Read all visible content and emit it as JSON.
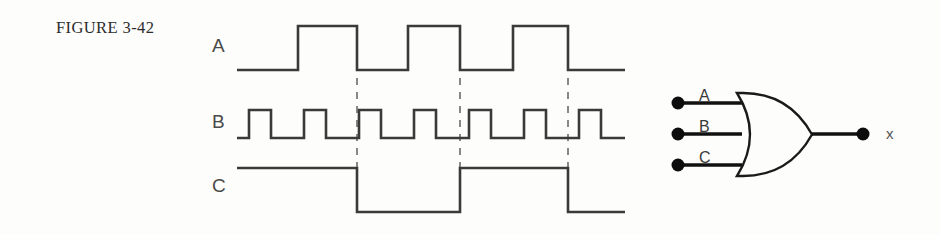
{
  "figure": {
    "caption": "FIGURE 3-42",
    "background_color": "#fdfdfb",
    "ink_color": "#3a3a3a"
  },
  "timing_diagram": {
    "signal_labels": {
      "a": "A",
      "b": "B",
      "c": "C"
    },
    "time_markers_x": [
      357,
      460,
      568
    ],
    "waveforms": {
      "A": {
        "label": "A",
        "start_x": 237,
        "end_x": 625,
        "low_y": 70,
        "high_y": 26,
        "transitions_x": [
          298,
          357,
          408,
          460,
          513,
          568
        ],
        "initial_level": "low",
        "pulse_count": 3
      },
      "B": {
        "label": "B",
        "start_x": 237,
        "end_x": 625,
        "low_y": 138,
        "high_y": 110,
        "initial_level": "low",
        "pulse_count": 7,
        "period_px": 55,
        "first_rise_x": 249,
        "pulse_width_px": 22
      },
      "C": {
        "label": "C",
        "start_x": 237,
        "end_x": 625,
        "low_y": 212,
        "high_y": 168,
        "transitions_x": [
          357,
          460,
          568
        ],
        "initial_level": "high",
        "pulse_count": 2
      }
    }
  },
  "logic_gate": {
    "type": "OR",
    "input_count": 3,
    "inputs": [
      {
        "label": "A",
        "terminal_x": 678,
        "terminal_y": 103,
        "wire_end_x": 742
      },
      {
        "label": "B",
        "terminal_x": 678,
        "terminal_y": 134,
        "wire_end_x": 742
      },
      {
        "label": "C",
        "terminal_x": 678,
        "terminal_y": 165,
        "wire_end_x": 742
      }
    ],
    "output": {
      "label": "x",
      "wire_start_x": 812,
      "terminal_x": 863,
      "terminal_y": 134
    },
    "body": {
      "left_x": 737,
      "right_x": 812,
      "top_y": 93,
      "bottom_y": 176
    }
  }
}
